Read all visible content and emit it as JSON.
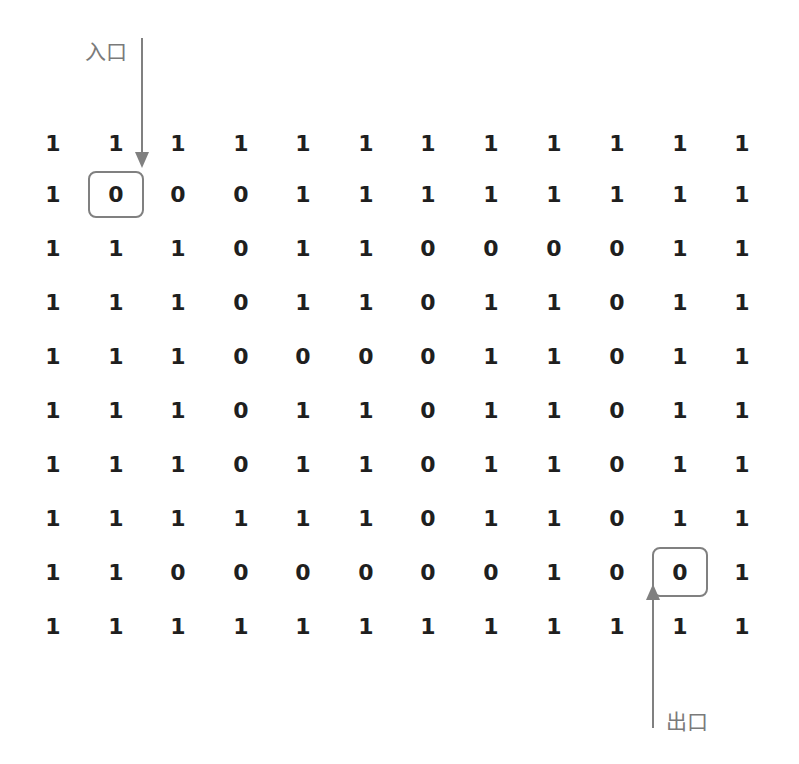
{
  "labels": {
    "entrance": "入口",
    "exit": "出口"
  },
  "colors": {
    "text": "#1f1f1f",
    "annotation": "#808080"
  },
  "maze": {
    "rows": 10,
    "cols": 12,
    "entrance_cell": [
      1,
      1
    ],
    "exit_cell": [
      8,
      10
    ],
    "grid": [
      [
        "1",
        "1",
        "1",
        "1",
        "1",
        "1",
        "1",
        "1",
        "1",
        "1",
        "1",
        "1"
      ],
      [
        "1",
        "0",
        "0",
        "0",
        "1",
        "1",
        "1",
        "1",
        "1",
        "1",
        "1",
        "1"
      ],
      [
        "1",
        "1",
        "1",
        "0",
        "1",
        "1",
        "0",
        "0",
        "0",
        "0",
        "1",
        "1"
      ],
      [
        "1",
        "1",
        "1",
        "0",
        "1",
        "1",
        "0",
        "1",
        "1",
        "0",
        "1",
        "1"
      ],
      [
        "1",
        "1",
        "1",
        "0",
        "0",
        "0",
        "0",
        "1",
        "1",
        "0",
        "1",
        "1"
      ],
      [
        "1",
        "1",
        "1",
        "0",
        "1",
        "1",
        "0",
        "1",
        "1",
        "0",
        "1",
        "1"
      ],
      [
        "1",
        "1",
        "1",
        "0",
        "1",
        "1",
        "0",
        "1",
        "1",
        "0",
        "1",
        "1"
      ],
      [
        "1",
        "1",
        "1",
        "1",
        "1",
        "1",
        "0",
        "1",
        "1",
        "0",
        "1",
        "1"
      ],
      [
        "1",
        "1",
        "0",
        "0",
        "0",
        "0",
        "0",
        "0",
        "1",
        "0",
        "0",
        "1"
      ],
      [
        "1",
        "1",
        "1",
        "1",
        "1",
        "1",
        "1",
        "1",
        "1",
        "1",
        "1",
        "1"
      ]
    ]
  }
}
